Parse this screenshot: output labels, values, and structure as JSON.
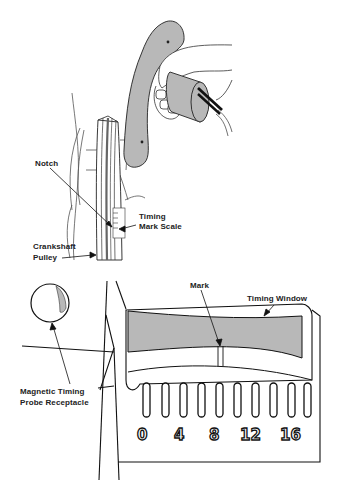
{
  "figure": {
    "top_panel": {
      "labels": {
        "notch": "Notch",
        "timing_mark_scale_line1": "Timing",
        "timing_mark_scale_line2": "Mark Scale",
        "crankshaft_pulley_line1": "Crankshaft",
        "crankshaft_pulley_line2": "Pulley"
      }
    },
    "bottom_panel": {
      "labels": {
        "mark": "Mark",
        "timing_window": "Timing Window",
        "probe_receptacle_line1": "Magnetic Timing",
        "probe_receptacle_line2": "Probe Receptacle"
      },
      "scale_numbers": [
        "0",
        "4",
        "8",
        "12",
        "16"
      ]
    },
    "colors": {
      "line": "#1a1a1a",
      "fill_gray": "#b8b8b8",
      "background": "#ffffff"
    }
  }
}
